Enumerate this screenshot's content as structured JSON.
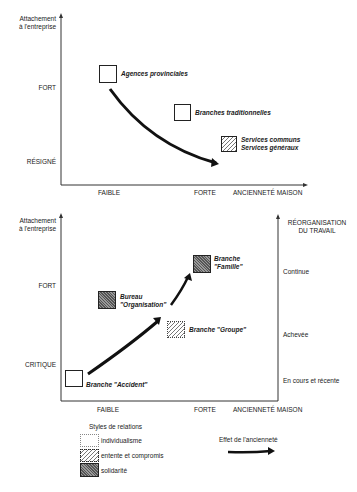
{
  "top_chart": {
    "y_axis_label": "Attachement\nà l'entreprise",
    "y_axis_label_1": "Attachement",
    "y_axis_label_2": "à l'entreprise",
    "y_ticks": [
      "FORT",
      "RÉSIGNÉ"
    ],
    "x_ticks": [
      "FAIBLE",
      "FORTE"
    ],
    "x_axis_label": "ANCIENNETÉ MAISON",
    "items": [
      {
        "label": "Agences provinciales",
        "style": "individualisme"
      },
      {
        "label": "Branches traditionnelles",
        "style": "individualisme"
      },
      {
        "label_1": "Services communs",
        "label_2": "Services généraux",
        "style": "entente et compromis"
      }
    ]
  },
  "bottom_chart": {
    "y_axis_label_1": "Attachement",
    "y_axis_label_2": "à l'entreprise",
    "y_ticks": [
      "FORT",
      "CRITIQUE"
    ],
    "x_ticks": [
      "FAIBLE",
      "FORTE"
    ],
    "x_axis_label": "ANCIENNETÉ MAISON",
    "right_axis_label_1": "RÉORGANISATION",
    "right_axis_label_2": "DU TRAVAIL",
    "right_ticks": [
      "Continue",
      "Achevée",
      "En cours et récente"
    ],
    "items": [
      {
        "label_1": "Branche",
        "label_2": "\"Famille\"",
        "style": "solidarité"
      },
      {
        "label_1": "Bureau",
        "label_2": "\"Organisation\"",
        "style": "solidarité"
      },
      {
        "label": "Branche \"Groupe\"",
        "style": "entente et compromis"
      },
      {
        "label": "Branche \"Accident\"",
        "style": "individualisme"
      }
    ]
  },
  "legend": {
    "title": "Styles de relations",
    "entries": [
      "individualisme",
      "entente et compromis",
      "solidarité"
    ],
    "arrow_label": "Effet de l'ancienneté"
  }
}
